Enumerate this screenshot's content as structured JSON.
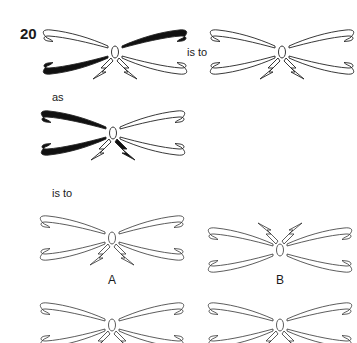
{
  "question": {
    "number": "20",
    "connector_1": "is to",
    "connector_2": "as",
    "connector_3": "is to"
  },
  "options": [
    {
      "label": "A"
    },
    {
      "label": "B"
    },
    {
      "label": "C"
    },
    {
      "label": "D"
    }
  ],
  "figures": {
    "stem_1": {
      "wings_filled": [
        "upper-right",
        "lower-left"
      ],
      "bolts_filled": []
    },
    "stem_2": {
      "wings_filled": [],
      "bolts_filled": []
    },
    "stem_3": {
      "wings_filled": [
        "upper-left",
        "lower-left"
      ],
      "bolts_filled": [
        "right"
      ]
    },
    "option_a": {
      "wings_filled": [],
      "bolts_filled": [],
      "bolts_position": "below"
    },
    "option_b": {
      "wings_filled": [],
      "bolts_filled": [],
      "bolts_position": "above"
    },
    "option_c": {
      "wings_filled": [],
      "bolts_filled": [],
      "bolts_position": "below"
    },
    "option_d": {
      "wings_filled": [],
      "bolts_filled": [],
      "bolts_position": "below"
    }
  }
}
